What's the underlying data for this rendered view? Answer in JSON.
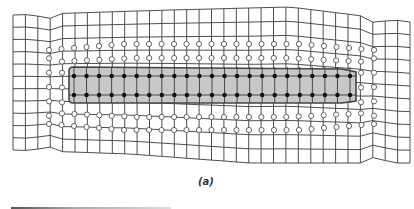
{
  "figure": {
    "caption": "(a)",
    "colors": {
      "grid_line": "#3a3a3a",
      "shaded_fill": "#c8c8c8",
      "shaded_border": "#444444",
      "filled_node": "#111111",
      "open_node_fill": "#ffffff",
      "open_node_stroke": "#555555"
    },
    "grid": {
      "columns": 33,
      "rows": 12,
      "top_edge": [
        [
          13,
          15
        ],
        [
          170,
          10
        ],
        [
          290,
          7
        ],
        [
          410,
          22
        ]
      ],
      "bottom_edge": [
        [
          13,
          150
        ],
        [
          130,
          154
        ],
        [
          250,
          163
        ],
        [
          410,
          163
        ]
      ]
    },
    "shaded_region": {
      "x1": 69,
      "y1": 67,
      "x2": 356,
      "y2": 103
    },
    "filled_nodes": {
      "rows_y": [
        76,
        95
      ],
      "x_start": 74,
      "x_end": 350,
      "count": 23
    },
    "open_ring_inner": {
      "x_left": 62,
      "x_right": 361,
      "y_top": 58,
      "y_bottom": 117
    },
    "open_ring_outer": {
      "x_left": 49,
      "x_right": 374,
      "y_top": 44,
      "y_bottom": 130
    }
  }
}
